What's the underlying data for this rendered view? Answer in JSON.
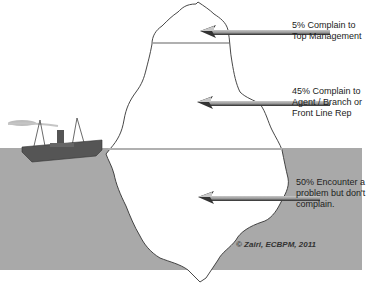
{
  "diagram": {
    "type": "iceberg",
    "colors": {
      "water": "#a9a9a9",
      "iceberg": "#ffffff",
      "outline": "#333333",
      "arrow_dark": "#2e2e2e",
      "arrow_light": "#b8b8b8",
      "ship": "#555555",
      "smoke": "#bdbdbd",
      "level_line": "#b0b0b0"
    },
    "labels": [
      {
        "id": "top",
        "lines": [
          "5% Complain to",
          "Top Management"
        ]
      },
      {
        "id": "middle",
        "lines": [
          "45% Complain to",
          "Agent / Branch or",
          "Front Line Rep"
        ]
      },
      {
        "id": "bottom",
        "lines": [
          "50% Encounter a",
          "problem but don't",
          "complain."
        ]
      }
    ],
    "credit": "© Zairi, ECBPM, 2011"
  }
}
